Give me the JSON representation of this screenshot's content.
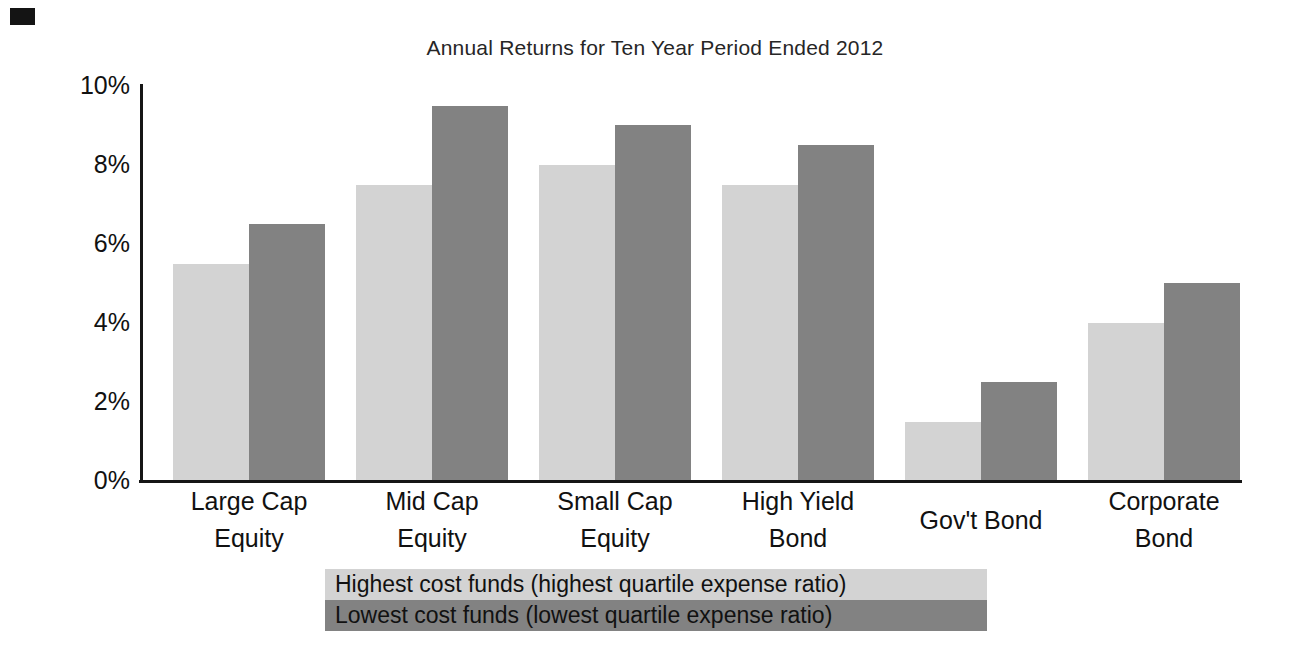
{
  "page": {
    "background": "#ffffff",
    "scan_mark_color": "#141414",
    "axis_color": "#161616",
    "text_color": "#111111"
  },
  "chart_data": {
    "type": "bar",
    "title": "Annual Returns for Ten Year Period Ended 2012",
    "xlabel": "",
    "ylabel": "",
    "ylim": [
      0,
      10
    ],
    "ytick_values": [
      0,
      2,
      4,
      6,
      8,
      10
    ],
    "ytick_labels": [
      "0%",
      "2%",
      "4%",
      "6%",
      "8%",
      "10%"
    ],
    "grid": false,
    "legend_position": "bottom",
    "categories": [
      [
        "Large Cap",
        "Equity"
      ],
      [
        "Mid Cap",
        "Equity"
      ],
      [
        "Small Cap",
        "Equity"
      ],
      [
        "High Yield",
        "Bond"
      ],
      [
        "Gov't Bond"
      ],
      [
        "Corporate",
        "Bond"
      ]
    ],
    "series": [
      {
        "name": "Highest cost funds (highest quartile expense ratio)",
        "color": "#d3d3d3",
        "values": [
          5.5,
          7.5,
          8.0,
          7.5,
          1.5,
          4.0
        ]
      },
      {
        "name": "Lowest cost funds (lowest quartile expense ratio)",
        "color": "#828282",
        "values": [
          6.5,
          9.5,
          9.0,
          8.5,
          2.5,
          5.0
        ]
      }
    ]
  }
}
